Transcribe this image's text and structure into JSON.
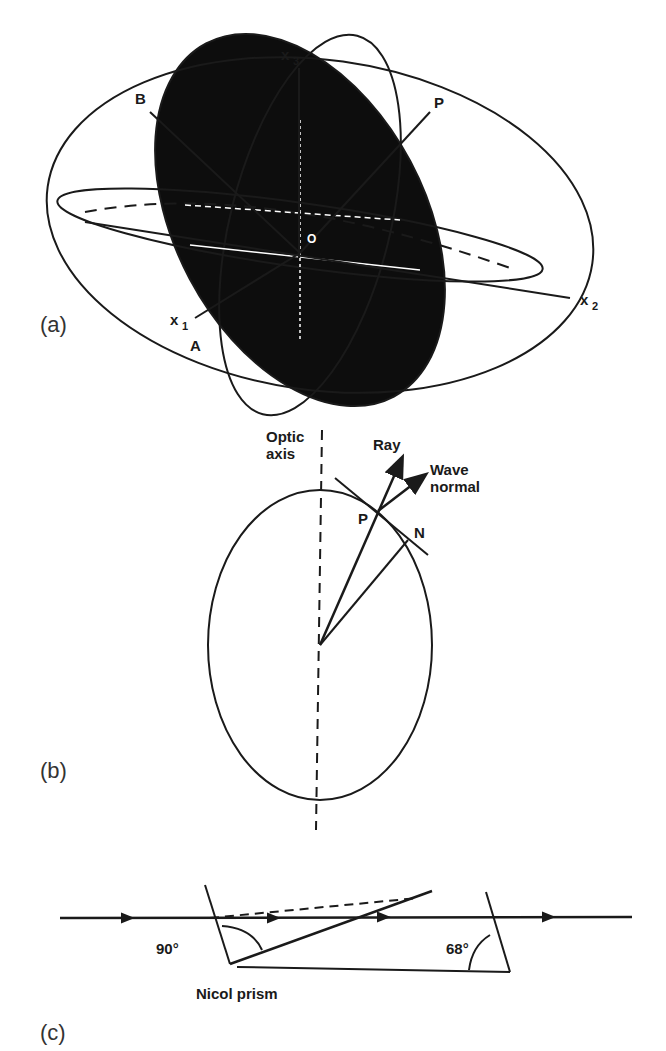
{
  "figure": {
    "panels": [
      {
        "id": "a",
        "label": "(a)",
        "axes": {
          "x1": "x",
          "x1_sub": "1",
          "x2": "x",
          "x2_sub": "2",
          "x3": "x",
          "x3_sub": "3"
        },
        "points": {
          "A": "A",
          "B": "B",
          "P": "P",
          "O": "O"
        }
      },
      {
        "id": "b",
        "label": "(b)",
        "optic_axis_line1": "Optic",
        "optic_axis_line2": "axis",
        "ray": "Ray",
        "wave_normal_line1": "Wave",
        "wave_normal_line2": "normal",
        "point_p": "P",
        "point_n": "N"
      },
      {
        "id": "c",
        "label": "(c)",
        "angle_left": "90°",
        "angle_right": "68°",
        "caption": "Nicol prism"
      }
    ]
  },
  "colors": {
    "ink": "#1a1a1a",
    "fill": "#0d0d0d",
    "background": "#ffffff"
  }
}
